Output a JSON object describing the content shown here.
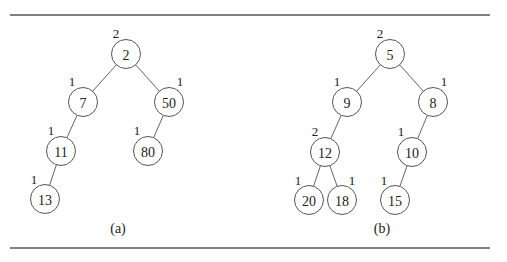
{
  "diagram": {
    "node_radius": 14.5,
    "rules": {
      "x1": 10,
      "x2": 490,
      "top_y": 15,
      "bottom_y": 248
    },
    "trees": [
      {
        "caption": "(a)",
        "caption_pos": [
          118,
          233
        ],
        "nodes": [
          {
            "id": "a-2",
            "key": "2",
            "rank": "2",
            "x": 126,
            "y": 54,
            "rank_pos": [
              116,
              38
            ]
          },
          {
            "id": "a-7",
            "key": "7",
            "rank": "1",
            "x": 83,
            "y": 102,
            "rank_pos": [
              72,
              86
            ]
          },
          {
            "id": "a-50",
            "key": "50",
            "rank": "1",
            "x": 169,
            "y": 102,
            "rank_pos": [
              180,
              86
            ]
          },
          {
            "id": "a-11",
            "key": "11",
            "rank": "1",
            "x": 61,
            "y": 151,
            "rank_pos": [
              51,
              135
            ]
          },
          {
            "id": "a-80",
            "key": "80",
            "rank": "1",
            "x": 148,
            "y": 151,
            "rank_pos": [
              137,
              135
            ]
          },
          {
            "id": "a-13",
            "key": "13",
            "rank": "1",
            "x": 45,
            "y": 199,
            "rank_pos": [
              34,
              184
            ]
          }
        ],
        "edges": [
          [
            "a-2",
            "a-7"
          ],
          [
            "a-2",
            "a-50"
          ],
          [
            "a-7",
            "a-11"
          ],
          [
            "a-50",
            "a-80"
          ],
          [
            "a-11",
            "a-13"
          ]
        ]
      },
      {
        "caption": "(b)",
        "caption_pos": [
          382,
          233
        ],
        "nodes": [
          {
            "id": "b-5",
            "key": "5",
            "rank": "2",
            "x": 390,
            "y": 54,
            "rank_pos": [
              380,
              38
            ]
          },
          {
            "id": "b-9",
            "key": "9",
            "rank": "1",
            "x": 347,
            "y": 102,
            "rank_pos": [
              337,
              86
            ]
          },
          {
            "id": "b-8",
            "key": "8",
            "rank": "1",
            "x": 433,
            "y": 102,
            "rank_pos": [
              444,
              86
            ]
          },
          {
            "id": "b-12",
            "key": "12",
            "rank": "2",
            "x": 325,
            "y": 152,
            "rank_pos": [
              315,
              136
            ]
          },
          {
            "id": "b-10",
            "key": "10",
            "rank": "1",
            "x": 412,
            "y": 152,
            "rank_pos": [
              401,
              136
            ]
          },
          {
            "id": "b-20",
            "key": "20",
            "rank": "1",
            "x": 309,
            "y": 200,
            "rank_pos": [
              298,
              185
            ]
          },
          {
            "id": "b-18",
            "key": "18",
            "rank": "1",
            "x": 342,
            "y": 200,
            "rank_pos": [
              352,
              185
            ]
          },
          {
            "id": "b-15",
            "key": "15",
            "rank": "1",
            "x": 395,
            "y": 200,
            "rank_pos": [
              384,
              185
            ]
          }
        ],
        "edges": [
          [
            "b-5",
            "b-9"
          ],
          [
            "b-5",
            "b-8"
          ],
          [
            "b-9",
            "b-12"
          ],
          [
            "b-8",
            "b-10"
          ],
          [
            "b-12",
            "b-20"
          ],
          [
            "b-12",
            "b-18"
          ],
          [
            "b-10",
            "b-15"
          ]
        ]
      }
    ]
  }
}
